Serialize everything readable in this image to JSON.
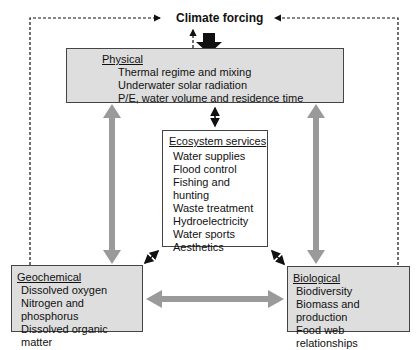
{
  "diagram": {
    "title": "Climate forcing",
    "physical": {
      "heading": "Physical",
      "items": [
        "Thermal regime and mixing",
        "Underwater solar radiation",
        "P/E, water volume and residence time"
      ]
    },
    "services": {
      "heading": "Ecosystem services",
      "items": [
        "Water supplies",
        "Flood control",
        "Fishing and hunting",
        "Waste treatment",
        "Hydroelectricity",
        "Water sports",
        "Aesthetics"
      ]
    },
    "geochemical": {
      "heading": "Geochemical",
      "items": [
        "Dissolved oxygen",
        "Nitrogen and phosphorus",
        "Dissolved organic matter"
      ]
    },
    "biological": {
      "heading": "Biological",
      "items": [
        "Biodiversity",
        "Biomass and production",
        "Food web relationships"
      ]
    },
    "colors": {
      "box_fill": "#dedede",
      "arrow_gray": "#9a9a9a",
      "line": "#111111"
    }
  }
}
